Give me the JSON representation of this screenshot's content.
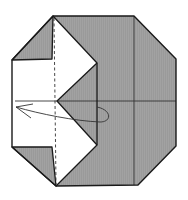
{
  "diagram": {
    "type": "origami-fold-step",
    "colors": {
      "paper_back": "#9a9a9a",
      "paper_front": "#ffffff",
      "line": "#1a1a1a",
      "crease": "#333333",
      "arrow": "#333333"
    },
    "shapes": {
      "octagon_outline": "53,16 134,16 176,59 176,146 138,185 56,186 12,147 12,60",
      "gray_body": "53,16 134,16 176,59 176,146 138,185 56,186 97,145 97,63",
      "top_left_triangle": "12,60 53,16 52,59",
      "bottom_left_triangle": "12,147 52,147 56,186",
      "white_flap": "12,60 52,59 53,16 97,63 57,101 97,145 56,186 52,147 12,147",
      "inner_gray_wedge": "97,63 57,101 97,145"
    },
    "creases": {
      "vertical_right": {
        "x1": 134,
        "y1": 16,
        "x2": 134,
        "y2": 185
      },
      "horizontal_center": {
        "x1": 15,
        "y1": 101,
        "x2": 176,
        "y2": 101
      },
      "valley_fold_dashed": {
        "x1": 54,
        "y1": 18,
        "x2": 56,
        "y2": 184
      }
    },
    "arrow": {
      "label": "turn-over / fold-behind arrow",
      "path": "M16,107 C40,114 75,121 100,122 C112,122 112,110 97,107",
      "head": "M33,104 L16,107 L31,118"
    }
  }
}
